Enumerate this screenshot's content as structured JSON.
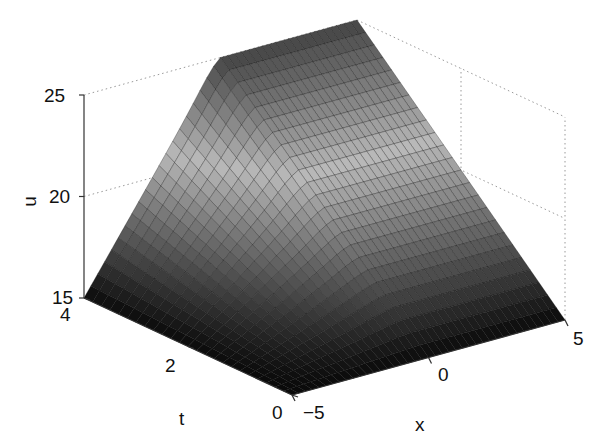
{
  "chart_data": {
    "type": "surface",
    "title": "",
    "xlabel": "x",
    "ylabel": "t",
    "zlabel": "u",
    "xlim": [
      -5,
      5
    ],
    "ylim": [
      0,
      4
    ],
    "zlim": [
      15,
      25
    ],
    "xticks": [
      "-5",
      "0",
      "5"
    ],
    "yticks": [
      "0",
      "2",
      "4"
    ],
    "zticks": [
      "15",
      "20",
      "25"
    ],
    "grid": true,
    "colormap": "gray",
    "samples": {
      "x": [
        -5,
        -2.5,
        0,
        2.5,
        5
      ],
      "t": [
        0,
        2,
        4
      ],
      "u": [
        [
          15,
          15,
          15,
          15,
          15
        ],
        [
          15,
          17.5,
          20,
          20,
          20
        ],
        [
          15,
          20,
          25,
          25,
          25
        ]
      ]
    }
  },
  "labels": {
    "z_axis": "u",
    "y_axis": "t",
    "x_axis": "x",
    "z_tick_25": "25",
    "z_tick_20": "20",
    "z_tick_15": "15",
    "t_tick_4": "4",
    "t_tick_2": "2",
    "t_tick_0": "0",
    "x_tick_m5": "−5",
    "x_tick_0": "0",
    "x_tick_5": "5"
  },
  "colors": {
    "background": "#ffffff",
    "axis": "#333333",
    "grid": "#9a9a9a",
    "surface_dark": "#0a0a0a",
    "surface_light": "#b8b8b8"
  }
}
